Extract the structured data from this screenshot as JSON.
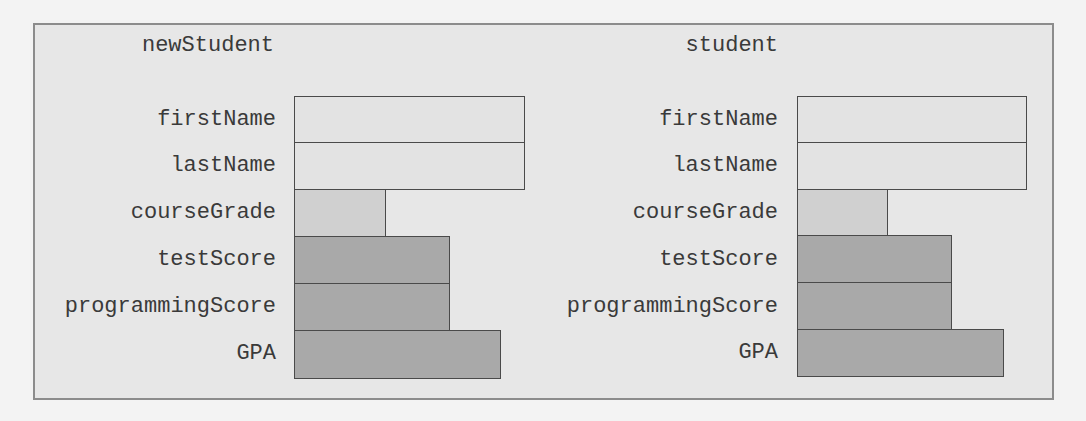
{
  "colors": {
    "page_bg": "#f3f3f3",
    "frame_bg": "#e7e7e7",
    "frame_border": "#8c8c8c",
    "cell_border": "#4a4a4a",
    "string_fill": "#e3e3e3",
    "char_fill": "#d0d0d0",
    "numeric_fill": "#a9a9a9"
  },
  "objects": [
    {
      "name": "newStudent",
      "fields": [
        {
          "label": "firstName",
          "kind": "string"
        },
        {
          "label": "lastName",
          "kind": "string"
        },
        {
          "label": "courseGrade",
          "kind": "char"
        },
        {
          "label": "testScore",
          "kind": "numeric"
        },
        {
          "label": "programmingScore",
          "kind": "numeric"
        },
        {
          "label": "GPA",
          "kind": "wide-numeric"
        }
      ]
    },
    {
      "name": "student",
      "fields": [
        {
          "label": "firstName",
          "kind": "string"
        },
        {
          "label": "lastName",
          "kind": "string"
        },
        {
          "label": "courseGrade",
          "kind": "char"
        },
        {
          "label": "testScore",
          "kind": "numeric"
        },
        {
          "label": "programmingScore",
          "kind": "numeric"
        },
        {
          "label": "GPA",
          "kind": "wide-numeric"
        }
      ]
    }
  ]
}
